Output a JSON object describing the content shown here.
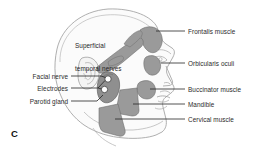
{
  "figure": {
    "panel_letter": "C",
    "type": "anatomical-illustration",
    "background_color": "#ffffff",
    "outline_color": "#8f8f8f",
    "shape_fill_color": "#9a9a9a",
    "shape_stroke_color": "#6f6f6f",
    "leader_color": "#262626",
    "text_color": "#2b2b2b"
  },
  "labels": {
    "inner": [
      {
        "id": "superficial-temporal-nerves",
        "line1": "Superficial",
        "line2": "temporal nerves",
        "x": 75,
        "y": 30
      }
    ],
    "left": [
      {
        "id": "facial-nerve",
        "text": "Facial nerve",
        "x": 68,
        "y": 76
      },
      {
        "id": "electrodes",
        "text": "Electrodes",
        "x": 68,
        "y": 88
      },
      {
        "id": "parotid-gland",
        "text": "Parotid gland",
        "x": 68,
        "y": 101
      }
    ],
    "right": [
      {
        "id": "frontalis-muscle",
        "text": "Frontalis muscle",
        "x": 188,
        "y": 30
      },
      {
        "id": "orbicularis-oculi",
        "text": "Orbicularis oculi",
        "x": 188,
        "y": 62
      },
      {
        "id": "buccinator-muscle",
        "text": "Buccinator muscle",
        "x": 188,
        "y": 88
      },
      {
        "id": "mandible",
        "text": "Mandible",
        "x": 188,
        "y": 103
      },
      {
        "id": "cervical-muscle",
        "text": "Cervical muscle",
        "x": 188,
        "y": 118
      }
    ]
  },
  "structures": [
    {
      "id": "frontalis-muscle",
      "name": "frontalis muscle"
    },
    {
      "id": "orbicularis-oculi",
      "name": "orbicularis oculi"
    },
    {
      "id": "buccinator-muscle",
      "name": "buccinator muscle"
    },
    {
      "id": "mandible",
      "name": "mandible"
    },
    {
      "id": "cervical-muscle",
      "name": "cervical muscle"
    },
    {
      "id": "parotid-gland",
      "name": "parotid gland"
    },
    {
      "id": "superficial-temporal-nerves",
      "name": "superficial temporal nerves"
    },
    {
      "id": "electrode-upper",
      "name": "electrode"
    },
    {
      "id": "electrode-lower",
      "name": "electrode"
    }
  ]
}
